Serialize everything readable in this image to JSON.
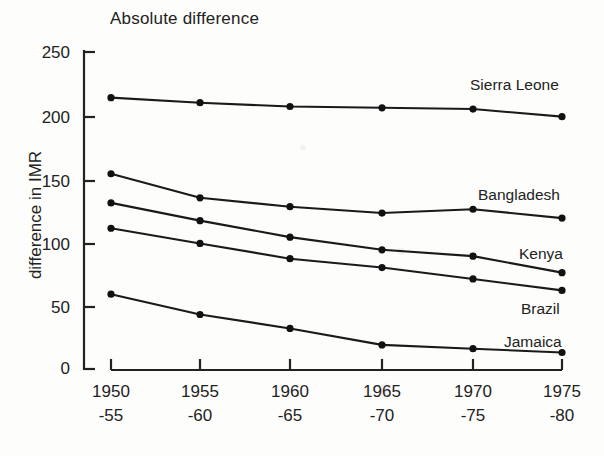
{
  "chart_data": {
    "type": "line",
    "title": "Absolute difference",
    "xlabel": "",
    "ylabel": "difference in IMR",
    "categories": [
      "1950\n-55",
      "1955\n-60",
      "1960\n-65",
      "1965\n-70",
      "1970\n-75",
      "1975\n-80"
    ],
    "x_tick_labels_top": [
      "1950",
      "1955",
      "1960",
      "1965",
      "1970",
      "1975"
    ],
    "x_tick_labels_bottom": [
      "-55",
      "-60",
      "-65",
      "-70",
      "-75",
      "-80"
    ],
    "y_tick_labels": [
      "250",
      "200",
      "150",
      "100",
      "50",
      "0"
    ],
    "y_ticks": [
      250,
      200,
      150,
      100,
      50,
      0
    ],
    "ylim": [
      0,
      250
    ],
    "grid": false,
    "legend": "inline-right-labels",
    "series": [
      {
        "name": "Sierra Leone",
        "values": [
          214,
          210,
          207,
          206,
          205,
          199
        ]
      },
      {
        "name": "Bangladesh",
        "values": [
          154,
          135,
          128,
          123,
          126,
          119
        ]
      },
      {
        "name": "Kenya",
        "values": [
          131,
          117,
          104,
          94,
          89,
          76
        ]
      },
      {
        "name": "Brazil",
        "values": [
          111,
          99,
          87,
          80,
          71,
          62
        ]
      },
      {
        "name": "Jamaica",
        "values": [
          59,
          43,
          32,
          19,
          16,
          13
        ]
      }
    ]
  },
  "style": {
    "line_color": "#1a1a1a",
    "marker_color": "#111111",
    "axis_color": "#222222",
    "background": "#fdfdfb"
  }
}
